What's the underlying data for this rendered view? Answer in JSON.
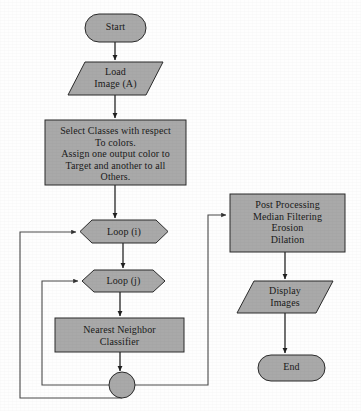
{
  "diagram": {
    "type": "flowchart",
    "title_visible": false,
    "colors": {
      "shape_fill": "#a9a9a9",
      "shape_border": "#2b2b2b",
      "connector": "#4a4a4a",
      "text": "#1a1a1a",
      "background": "#fefefe"
    },
    "nodes": [
      {
        "id": "start",
        "shape": "terminator",
        "label": "Start"
      },
      {
        "id": "load_image",
        "shape": "parallelogram",
        "label": "Load\nImage (A)"
      },
      {
        "id": "select_classes",
        "shape": "process",
        "label": "Select Classes with respect\nTo colors.\nAssign one output color to\nTarget and another to all\nOthers."
      },
      {
        "id": "loop_i",
        "shape": "preparation",
        "label": "Loop (i)"
      },
      {
        "id": "loop_j",
        "shape": "preparation",
        "label": "Loop (j)"
      },
      {
        "id": "classifier",
        "shape": "process",
        "label": "Nearest Neighbor\nClassifier"
      },
      {
        "id": "junction",
        "shape": "connector-circle",
        "label": ""
      },
      {
        "id": "post_processing",
        "shape": "process",
        "label": "Post Processing\nMedian Filtering\nErosion\nDilation"
      },
      {
        "id": "display",
        "shape": "parallelogram",
        "label": "Display\nImages"
      },
      {
        "id": "end",
        "shape": "terminator",
        "label": "End"
      }
    ],
    "edges": [
      {
        "from": "start",
        "to": "load_image",
        "kind": "straight"
      },
      {
        "from": "load_image",
        "to": "select_classes",
        "kind": "straight"
      },
      {
        "from": "select_classes",
        "to": "loop_i",
        "kind": "straight"
      },
      {
        "from": "loop_i",
        "to": "loop_j",
        "kind": "straight"
      },
      {
        "from": "loop_j",
        "to": "classifier",
        "kind": "straight"
      },
      {
        "from": "classifier",
        "to": "junction",
        "kind": "straight"
      },
      {
        "from": "junction",
        "to": "loop_j",
        "kind": "loop-back-inner"
      },
      {
        "from": "junction",
        "to": "loop_i",
        "kind": "loop-back-outer"
      },
      {
        "from": "junction",
        "to": "post_processing",
        "kind": "branch-right"
      },
      {
        "from": "post_processing",
        "to": "display",
        "kind": "straight"
      },
      {
        "from": "display",
        "to": "end",
        "kind": "straight"
      }
    ]
  }
}
